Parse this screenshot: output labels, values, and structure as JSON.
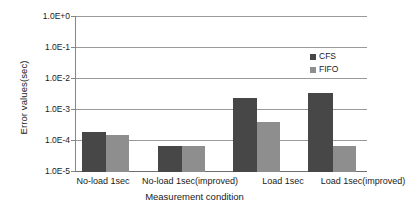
{
  "chart_data": {
    "type": "bar",
    "title": "",
    "xlabel": "Measurement condition",
    "ylabel": "Error values(sec)",
    "yscale": "log",
    "ylim": [
      1e-05,
      1
    ],
    "grid": true,
    "legend_position": "top-right",
    "categories": [
      "No-load 1sec",
      "No-load 1sec(improved)",
      "Load 1sec",
      "Load 1sec(improved)"
    ],
    "ytick_labels": [
      "1.0E+0",
      "1.0E-1",
      "1.0E-2",
      "1.0E-3",
      "1.0E-4",
      "1.0E-5"
    ],
    "ytick_values": [
      1,
      0.1,
      0.01,
      0.001,
      0.0001,
      1e-05
    ],
    "series": [
      {
        "name": "CFS",
        "color": "#474747",
        "values": [
          0.00019,
          6.6e-05,
          0.0024,
          0.0033
        ]
      },
      {
        "name": "FIFO",
        "color": "#8e8e8e",
        "values": [
          0.00015,
          6.6e-05,
          0.0004,
          7e-05
        ]
      }
    ]
  }
}
